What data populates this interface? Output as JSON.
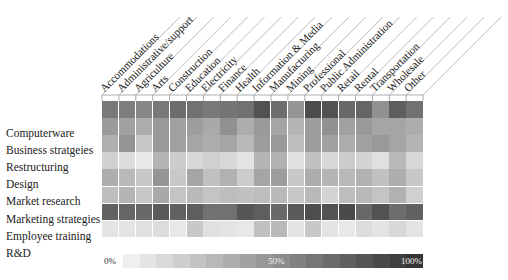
{
  "chart_data": {
    "type": "heatmap",
    "title": "",
    "columns": [
      "Accommodations",
      "Administrative/support",
      "Agriculture",
      "Arts",
      "Construction",
      "Education",
      "Electricity",
      "Finance",
      "Health",
      "Information & Media",
      "Manufacturing",
      "Mining",
      "Professional",
      "Public Administration",
      "Retail",
      "Rental",
      "Transportation",
      "Wholesale",
      "Other"
    ],
    "rows": [
      "Computerware",
      "Business stratgeies",
      "Restructuring",
      "Design",
      "Market research",
      "Marketing strategies",
      "Employee training",
      "R&D"
    ],
    "values": [
      [
        62,
        60,
        55,
        62,
        68,
        66,
        62,
        64,
        66,
        82,
        68,
        48,
        85,
        82,
        70,
        72,
        50,
        76,
        66
      ],
      [
        45,
        42,
        36,
        46,
        42,
        44,
        38,
        50,
        36,
        46,
        40,
        32,
        44,
        50,
        42,
        46,
        40,
        40,
        36
      ],
      [
        35,
        48,
        22,
        46,
        42,
        40,
        36,
        40,
        30,
        44,
        46,
        28,
        44,
        42,
        36,
        42,
        46,
        40,
        32
      ],
      [
        18,
        12,
        6,
        32,
        20,
        14,
        18,
        14,
        8,
        32,
        34,
        10,
        26,
        14,
        20,
        16,
        10,
        30,
        14
      ],
      [
        36,
        30,
        22,
        48,
        22,
        40,
        26,
        34,
        20,
        40,
        44,
        22,
        36,
        32,
        30,
        34,
        26,
        36,
        22
      ],
      [
        28,
        32,
        22,
        38,
        24,
        30,
        24,
        28,
        26,
        28,
        30,
        22,
        30,
        16,
        28,
        30,
        24,
        34,
        18
      ],
      [
        74,
        72,
        70,
        78,
        74,
        76,
        66,
        66,
        80,
        76,
        70,
        78,
        84,
        82,
        86,
        70,
        82,
        68,
        74
      ],
      [
        8,
        8,
        10,
        12,
        6,
        22,
        10,
        8,
        6,
        26,
        30,
        8,
        22,
        8,
        6,
        12,
        8,
        14,
        8
      ]
    ],
    "value_range": [
      0,
      100
    ],
    "unit": "%",
    "color_scale": {
      "low": "#f4f4f4",
      "high": "#2e2e2e"
    },
    "legend": {
      "position": "bottom",
      "labels": [
        "0%",
        "50%",
        "100%"
      ],
      "steps": 18
    }
  }
}
